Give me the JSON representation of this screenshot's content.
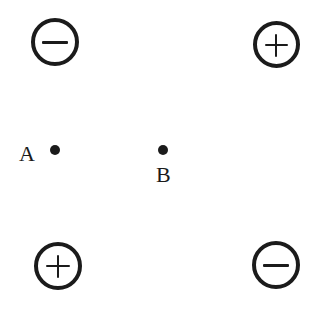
{
  "figure": {
    "width": 330,
    "height": 314,
    "background_color": "#ffffff",
    "ink_color": "#1b1b1b"
  },
  "charges": [
    {
      "id": "charge-top-left",
      "sign": "−",
      "sign_name": "minus",
      "polarity": "negative",
      "position": "top-left",
      "cx": 55,
      "cy": 42,
      "diameter": 48,
      "stroke": 4
    },
    {
      "id": "charge-top-right",
      "sign": "+",
      "sign_name": "plus",
      "polarity": "positive",
      "position": "top-right",
      "cx": 277,
      "cy": 45,
      "diameter": 47,
      "stroke": 4
    },
    {
      "id": "charge-bottom-left",
      "sign": "+",
      "sign_name": "plus",
      "polarity": "positive",
      "position": "bottom-left",
      "cx": 58,
      "cy": 266,
      "diameter": 48,
      "stroke": 4
    },
    {
      "id": "charge-bottom-right",
      "sign": "−",
      "sign_name": "minus",
      "polarity": "negative",
      "position": "bottom-right",
      "cx": 276,
      "cy": 265,
      "diameter": 48,
      "stroke": 4
    }
  ],
  "points": [
    {
      "id": "point-a",
      "label": "A",
      "dot_cx": 55,
      "dot_cy": 150,
      "dot_radius": 5,
      "label_x": 19,
      "label_y": 143,
      "label_size": 22,
      "label_placement": "left"
    },
    {
      "id": "point-b",
      "label": "B",
      "dot_cx": 163,
      "dot_cy": 150,
      "dot_radius": 5,
      "label_x": 156,
      "label_y": 164,
      "label_size": 22,
      "label_placement": "below"
    }
  ]
}
